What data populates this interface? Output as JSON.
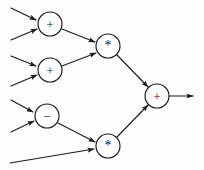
{
  "diagram": {
    "background_color": "#fdfdfd",
    "stroke_color": "#1b1b1b",
    "node_fill_color": "#ffffff",
    "node_radius": 12,
    "width": 204,
    "height": 170,
    "nodes": [
      {
        "id": "add1",
        "label": "+",
        "op": "plus",
        "cx": 50,
        "cy": 24,
        "name": "node-add-1"
      },
      {
        "id": "add2",
        "label": "+",
        "op": "plus",
        "cx": 50,
        "cy": 70,
        "name": "node-add-2"
      },
      {
        "id": "sub1",
        "label": "−",
        "op": "minus",
        "cx": 47,
        "cy": 116,
        "name": "node-subtract-1"
      },
      {
        "id": "mul1",
        "label": "*",
        "op": "times",
        "cx": 108,
        "cy": 46,
        "name": "node-multiply-1"
      },
      {
        "id": "mul2",
        "label": "*",
        "op": "times",
        "cx": 108,
        "cy": 146,
        "name": "node-multiply-2"
      },
      {
        "id": "add3",
        "label": "+",
        "op": "plus",
        "cx": 157,
        "cy": 96,
        "name": "node-add-3"
      }
    ],
    "input_edges": [
      {
        "name": "input-edge-1",
        "x1": 11,
        "y1": 8,
        "x2": 36,
        "y2": 20
      },
      {
        "name": "input-edge-2",
        "x1": 11,
        "y1": 40,
        "x2": 37,
        "y2": 29
      },
      {
        "name": "input-edge-3",
        "x1": 11,
        "y1": 56,
        "x2": 36,
        "y2": 66
      },
      {
        "name": "input-edge-4",
        "x1": 11,
        "y1": 86,
        "x2": 37,
        "y2": 75
      },
      {
        "name": "input-edge-5",
        "x1": 11,
        "y1": 100,
        "x2": 33,
        "y2": 112
      },
      {
        "name": "input-edge-6",
        "x1": 11,
        "y1": 132,
        "x2": 34,
        "y2": 121
      },
      {
        "name": "input-edge-7",
        "x1": 10,
        "y1": 163,
        "x2": 94,
        "y2": 149
      }
    ],
    "internal_edges": [
      {
        "name": "edge-add1-to-mul1",
        "x1": 62,
        "y1": 29,
        "x2": 95,
        "y2": 42
      },
      {
        "name": "edge-add2-to-mul1",
        "x1": 62,
        "y1": 66,
        "x2": 96,
        "y2": 53
      },
      {
        "name": "edge-mul1-to-add3",
        "x1": 117,
        "y1": 55,
        "x2": 148,
        "y2": 87
      },
      {
        "name": "edge-sub1-to-mul2",
        "x1": 58,
        "y1": 123,
        "x2": 95,
        "y2": 142
      },
      {
        "name": "edge-mul2-to-add3",
        "x1": 117,
        "y1": 137,
        "x2": 148,
        "y2": 105
      }
    ],
    "output_edge": {
      "name": "output-edge",
      "x1": 169,
      "y1": 96,
      "x2": 193,
      "y2": 96
    }
  }
}
